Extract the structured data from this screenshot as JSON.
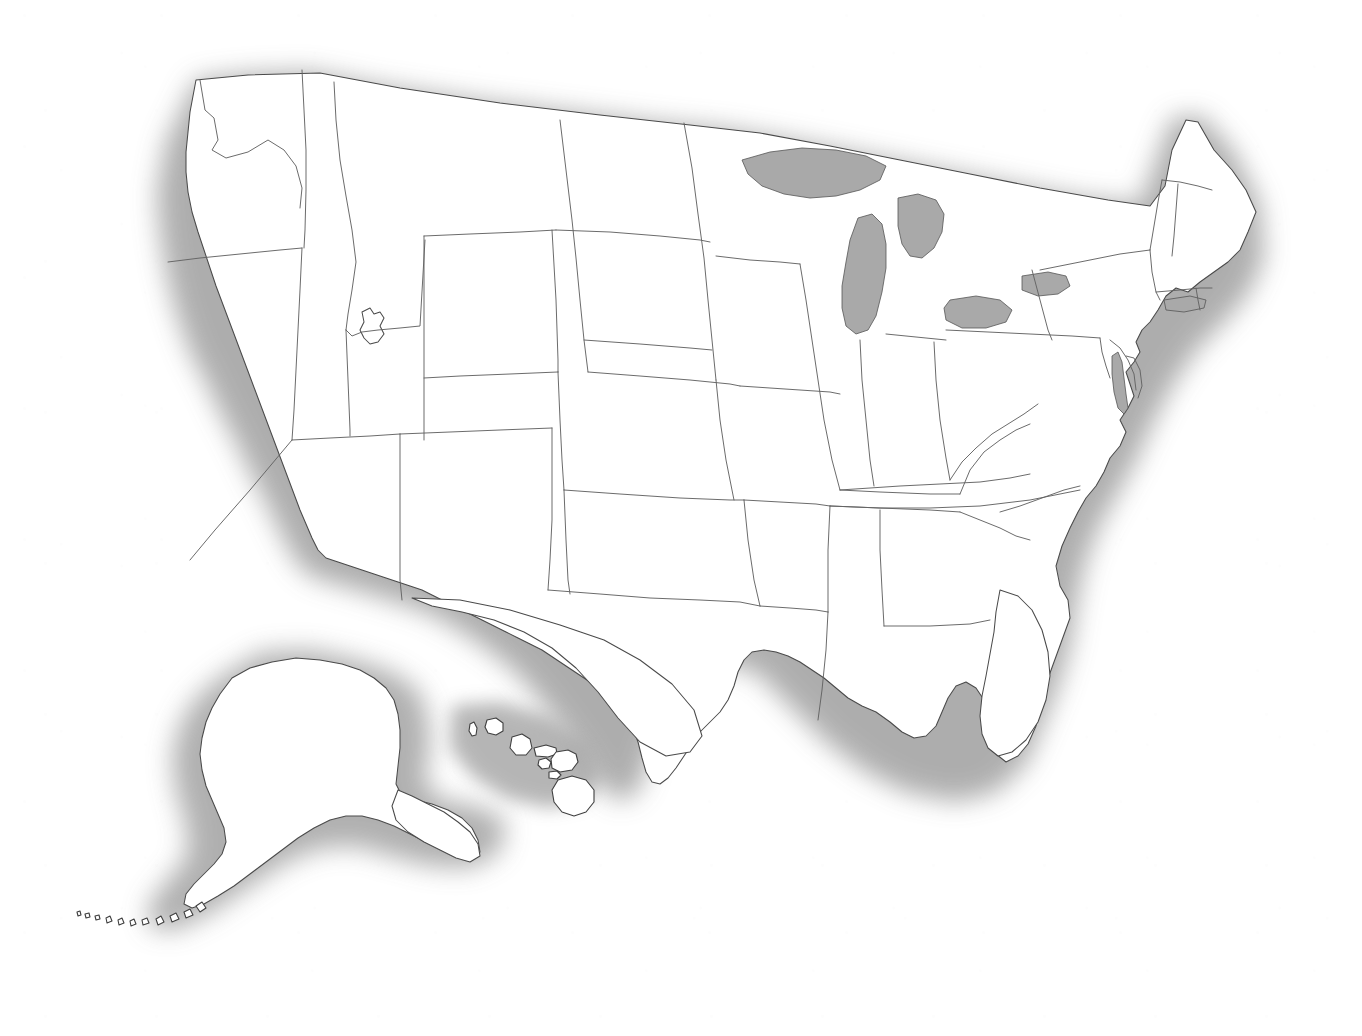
{
  "document": {
    "kind": "scanned-blank-outline-map",
    "title": "United States blank outline map",
    "page_width": 1362,
    "page_height": 1036,
    "background_color": "#ffffff",
    "has_visible_text": false,
    "has_labels": false,
    "has_legend": false,
    "has_title_text": false,
    "has_scale_bar": false,
    "has_compass_rose": false,
    "has_page_border": false
  },
  "style": {
    "land_fill": "#ffffff",
    "outline_color": "#4a4a4a",
    "state_border_color": "#636363",
    "lake_fill": "#a9a9a9",
    "halo_color": "#9c9c9c",
    "outline_width_px": 1.05,
    "state_border_width_px": 0.95,
    "halo_description": "soft gray airbrushed drop shadow / glow surrounding all coastlines and the national border",
    "paper_texture": "light scanner speckle and dust artifacts on white paper"
  },
  "map": {
    "projection_note": "conic-style projection of the conterminous United States",
    "regions": [
      {
        "name": "conterminous-united-states",
        "label": "Lower 48",
        "description": "48 contiguous states drawn with internal state boundaries, no labels"
      },
      {
        "name": "alaska-inset",
        "label": "Alaska",
        "description": "Alaska inset placed at lower left, with Aleutian island chain trailing to the southwest"
      },
      {
        "name": "hawaii-inset",
        "label": "Hawaii",
        "description": "Hawaiian island chain inset placed in lower center, eight islands"
      }
    ],
    "water_bodies": [
      {
        "name": "lake-superior",
        "label": "Lake Superior",
        "fill": "#a9a9a9"
      },
      {
        "name": "lake-michigan",
        "label": "Lake Michigan",
        "fill": "#a9a9a9"
      },
      {
        "name": "lake-huron",
        "label": "Lake Huron",
        "fill": "#a9a9a9"
      },
      {
        "name": "lake-erie",
        "label": "Lake Erie",
        "fill": "#a9a9a9"
      },
      {
        "name": "lake-ontario",
        "label": "Lake Ontario",
        "fill": "#a9a9a9"
      },
      {
        "name": "great-salt-lake",
        "label": "Great Salt Lake",
        "fill": "#ffffff"
      },
      {
        "name": "chesapeake-bay",
        "label": "Chesapeake Bay",
        "fill": "#a9a9a9"
      },
      {
        "name": "long-island-sound",
        "label": "Long Island Sound",
        "fill": "#a9a9a9"
      }
    ],
    "hawaiian_islands": [
      "Niihau",
      "Kauai",
      "Oahu",
      "Molokai",
      "Lanai",
      "Maui",
      "Kahoolawe",
      "Hawaii"
    ],
    "states_shown": [
      "Alabama",
      "Alaska",
      "Arizona",
      "Arkansas",
      "California",
      "Colorado",
      "Connecticut",
      "Delaware",
      "Florida",
      "Georgia",
      "Hawaii",
      "Idaho",
      "Illinois",
      "Indiana",
      "Iowa",
      "Kansas",
      "Kentucky",
      "Louisiana",
      "Maine",
      "Maryland",
      "Massachusetts",
      "Michigan",
      "Minnesota",
      "Mississippi",
      "Missouri",
      "Montana",
      "Nebraska",
      "Nevada",
      "New Hampshire",
      "New Jersey",
      "New Mexico",
      "New York",
      "North Carolina",
      "North Dakota",
      "Ohio",
      "Oklahoma",
      "Oregon",
      "Pennsylvania",
      "Rhode Island",
      "South Carolina",
      "South Dakota",
      "Tennessee",
      "Texas",
      "Utah",
      "Vermont",
      "Virginia",
      "Washington",
      "West Virginia",
      "Wisconsin",
      "Wyoming"
    ],
    "state_count": 50
  }
}
